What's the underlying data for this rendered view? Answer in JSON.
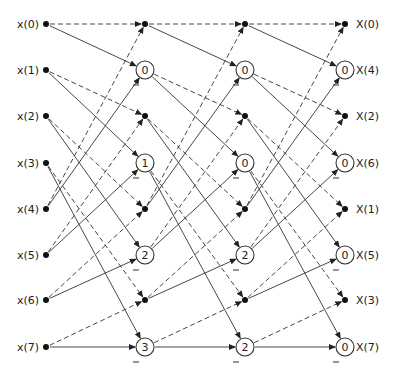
{
  "diagram": {
    "type": "8-point FFT signal flow graph (constant geometry)",
    "inputs": [
      "x(0)",
      "x(1)",
      "x(2)",
      "x(3)",
      "x(4)",
      "x(5)",
      "x(6)",
      "x(7)"
    ],
    "outputs": [
      "X(0)",
      "X(4)",
      "X(2)",
      "X(6)",
      "X(1)",
      "X(5)",
      "X(3)",
      "X(7)"
    ],
    "stages": [
      {
        "nodes": [
          "dot",
          "0",
          "dot",
          "1",
          "dot",
          "2",
          "dot",
          "3"
        ]
      },
      {
        "nodes": [
          "dot",
          "0",
          "dot",
          "0",
          "dot",
          "2",
          "dot",
          "2"
        ]
      },
      {
        "nodes": [
          "dot",
          "0",
          "dot",
          "0",
          "dot",
          "0",
          "dot",
          "0"
        ]
      }
    ],
    "minus_sign": "−",
    "edge_rule": "node r of previous column (r<4) and node r+4 feed next-column nodes 2r (dashed) and 2r+1 (solid)"
  }
}
